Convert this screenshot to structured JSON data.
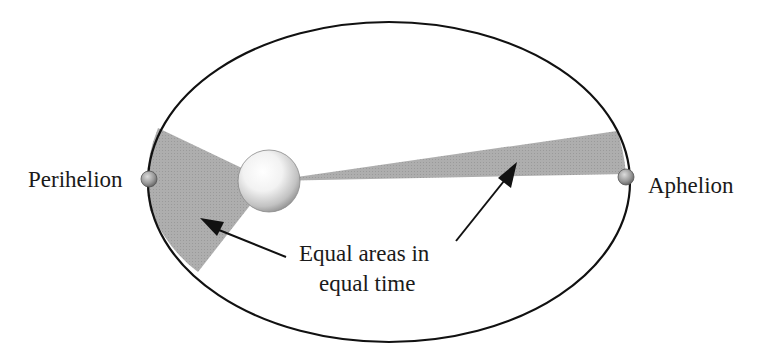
{
  "diagram": {
    "labels": {
      "perihelion": "Perihelion",
      "aphelion": "Aphelion",
      "equal_areas_line1": "Equal areas in",
      "equal_areas_line2": "equal time"
    },
    "colors": {
      "orbit": "#111111",
      "sector": "#a9a9a9",
      "text": "#1a1a1a"
    }
  }
}
